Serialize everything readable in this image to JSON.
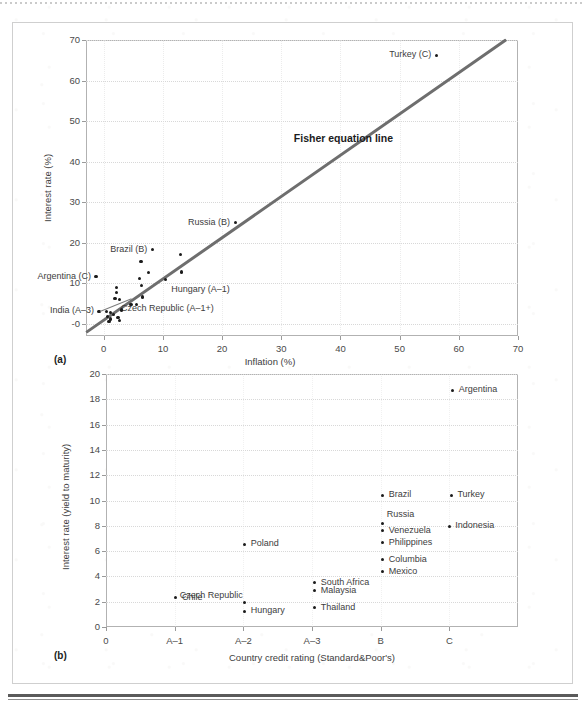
{
  "figure": {
    "panel_a_letter": "(a)",
    "panel_b_letter": "(b)"
  },
  "chart_data": [
    {
      "type": "scatter",
      "panel": "(a)",
      "title": "",
      "xlabel": "Inflation (%)",
      "ylabel": "Interest rate (%)",
      "xlim": [
        -3,
        70
      ],
      "ylim": [
        -3,
        70
      ],
      "xticks": [
        0,
        10,
        20,
        30,
        40,
        50,
        60,
        70
      ],
      "yticks": [
        0,
        10,
        20,
        30,
        40,
        50,
        60,
        70
      ],
      "ytick_labels": [
        "-0",
        "10",
        "20",
        "30",
        "40",
        "50",
        "60",
        "70"
      ],
      "xtick_labels": [
        "0",
        "10",
        "20",
        "30",
        "40",
        "50",
        "60",
        "70"
      ],
      "grid": "horizontal-dotted",
      "annotations": [
        {
          "text": "Fisher equation line",
          "x": 40.5,
          "y": 45.5
        }
      ],
      "trendline": {
        "name": "Fisher equation line",
        "x0": -3,
        "y0": -2.2,
        "x1": 68.0,
        "y1": 70.0,
        "color": "#6e6e6e"
      },
      "points": [
        {
          "label": "Turkey (C)",
          "x": 56.2,
          "y": 66.2,
          "label_side": "left"
        },
        {
          "label": "Russia (B)",
          "x": 22.2,
          "y": 24.9,
          "label_side": "left"
        },
        {
          "label": "Brazil (B)",
          "x": 8.2,
          "y": 18.3,
          "label_side": "left"
        },
        {
          "label": "Argentina (C)",
          "x": -1.3,
          "y": 11.6,
          "label_side": "left"
        },
        {
          "label": "Hungary (A–1)",
          "x": 10.4,
          "y": 10.9,
          "label_side": "right"
        },
        {
          "label": "Czech Republic (A–1+)",
          "x": 1.9,
          "y": 6.2,
          "label_side": "right"
        },
        {
          "label": "India (A–3)",
          "x": -0.8,
          "y": 3.1,
          "label_side": "left"
        },
        {
          "label": "",
          "x": 13.0,
          "y": 17.0
        },
        {
          "label": "",
          "x": 6.3,
          "y": 15.3
        },
        {
          "label": "",
          "x": 7.6,
          "y": 12.7
        },
        {
          "label": "",
          "x": 13.1,
          "y": 12.8
        },
        {
          "label": "",
          "x": 6.0,
          "y": 11.2
        },
        {
          "label": "",
          "x": 2.2,
          "y": 9.0
        },
        {
          "label": "",
          "x": 6.4,
          "y": 9.4
        },
        {
          "label": "",
          "x": 2.2,
          "y": 7.8
        },
        {
          "label": "",
          "x": 6.5,
          "y": 6.6
        },
        {
          "label": "",
          "x": 2.6,
          "y": 6.0
        },
        {
          "label": "",
          "x": 4.6,
          "y": 4.7
        },
        {
          "label": "",
          "x": 5.5,
          "y": 4.7
        },
        {
          "label": "",
          "x": 3.0,
          "y": 3.4
        },
        {
          "label": "",
          "x": 0.4,
          "y": 3.0
        },
        {
          "label": "",
          "x": 1.1,
          "y": 2.7
        },
        {
          "label": "",
          "x": 1.7,
          "y": 2.4
        },
        {
          "label": "",
          "x": 0.6,
          "y": 1.9
        },
        {
          "label": "",
          "x": 2.4,
          "y": 1.6
        },
        {
          "label": "",
          "x": 1.2,
          "y": 1.2
        },
        {
          "label": "",
          "x": 2.6,
          "y": 0.9
        },
        {
          "label": "",
          "x": 0.9,
          "y": 0.6
        }
      ]
    },
    {
      "type": "scatter",
      "panel": "(b)",
      "title": "",
      "xlabel": "Country credit rating (Standard&Poor's)",
      "ylabel": "Interest rate (yield to maturity)",
      "xlim": [
        0,
        6
      ],
      "ylim": [
        0,
        20
      ],
      "yticks": [
        0,
        2,
        4,
        6,
        8,
        10,
        12,
        14,
        16,
        18,
        20
      ],
      "xtick_labels": [
        "0",
        "A–1",
        "A–2",
        "A–3",
        "B",
        "C"
      ],
      "grid": "horizontal-dotted",
      "points": [
        {
          "label": "Argentina",
          "x": 5.05,
          "y": 18.7,
          "label_side": "right"
        },
        {
          "label": "Brazil",
          "x": 4.03,
          "y": 10.4,
          "label_side": "right"
        },
        {
          "label": "Turkey",
          "x": 5.03,
          "y": 10.4,
          "label_side": "right"
        },
        {
          "label": "Russia",
          "x": 4.03,
          "y": 8.2,
          "label_side": "right-above"
        },
        {
          "label": "Venezuela",
          "x": 4.03,
          "y": 7.6,
          "label_side": "right"
        },
        {
          "label": "Indonesia",
          "x": 5.0,
          "y": 7.95,
          "label_side": "right"
        },
        {
          "label": "Philippines",
          "x": 4.03,
          "y": 6.65,
          "label_side": "right"
        },
        {
          "label": "Poland",
          "x": 2.02,
          "y": 6.55,
          "label_side": "right"
        },
        {
          "label": "Columbia",
          "x": 4.03,
          "y": 5.3,
          "label_side": "right"
        },
        {
          "label": "Mexico",
          "x": 4.03,
          "y": 4.35,
          "label_side": "right"
        },
        {
          "label": "South Africa",
          "x": 3.04,
          "y": 3.5,
          "label_side": "right"
        },
        {
          "label": "Malaysia",
          "x": 3.04,
          "y": 2.85,
          "label_side": "right"
        },
        {
          "label": "Czech Republic",
          "x": 2.02,
          "y": 1.95,
          "label_side": "left-above"
        },
        {
          "label": "Chile",
          "x": 1.02,
          "y": 2.3,
          "label_side": "right"
        },
        {
          "label": "Thailand",
          "x": 3.04,
          "y": 1.5,
          "label_side": "right"
        },
        {
          "label": "Hungary",
          "x": 2.02,
          "y": 1.25,
          "label_side": "right"
        }
      ]
    }
  ]
}
